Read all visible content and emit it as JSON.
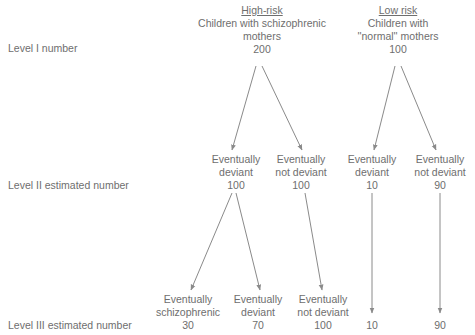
{
  "groups": {
    "high": {
      "title": "High-risk",
      "subtitle_line1": "Children with schizophrenic",
      "subtitle_line2": "mothers",
      "count": "200"
    },
    "low": {
      "title": "Low risk",
      "subtitle_line1": "Children with",
      "subtitle_line2": "''normal'' mothers",
      "count": "100"
    }
  },
  "levels": {
    "level1": "Level I number",
    "level2": "Level II estimated number",
    "level3": "Level III estimated number"
  },
  "level2_nodes": [
    {
      "line1": "Eventually",
      "line2": "deviant",
      "count": "100"
    },
    {
      "line1": "Eventually",
      "line2": "not deviant",
      "count": "100"
    },
    {
      "line1": "Eventually",
      "line2": "deviant",
      "count": "10"
    },
    {
      "line1": "Eventually",
      "line2": "not deviant",
      "count": "90"
    }
  ],
  "level3_nodes": [
    {
      "line1": "Eventually",
      "line2": "schizophrenic",
      "count": "30"
    },
    {
      "line1": "Eventually",
      "line2": "deviant",
      "count": "70"
    },
    {
      "line1": "Eventually",
      "line2": "not deviant",
      "count": "100"
    },
    {
      "count": "10"
    },
    {
      "count": "90"
    }
  ],
  "colors": {
    "text": "#6e6e6e",
    "arrow": "#8a8a8a",
    "background": "#ffffff"
  }
}
